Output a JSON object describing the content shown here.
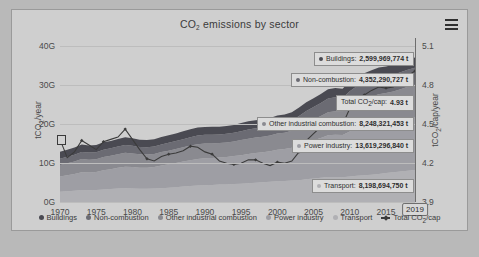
{
  "chart": {
    "title": "CO2 emissions by sector",
    "title_pre": "CO",
    "title_sub": "2",
    "title_post": " emissions by sector",
    "menu_icon": "hamburger-menu-icon"
  },
  "axes": {
    "left_title_pre": "tCO",
    "left_title_sub": "2",
    "left_title_post": "/year",
    "right_title_pre": "tCO",
    "right_title_sub": "2",
    "right_title_post": "/cap/year",
    "left_ticks": [
      "40G",
      "30G",
      "20G",
      "10G",
      "0G"
    ],
    "right_ticks": [
      "5.1",
      "4.8",
      "4.5",
      "4.2",
      "3.9"
    ],
    "x_ticks": [
      "1970",
      "1975",
      "1980",
      "1985",
      "1990",
      "1995",
      "2000",
      "2005",
      "2010",
      "2015"
    ],
    "marker_year": "2019"
  },
  "tooltips": [
    {
      "name": "Buildings",
      "value": "2,599,969,774 t",
      "color": "#4a4a52"
    },
    {
      "name": "Non-combustion",
      "value": "4,352,290,727 t",
      "color": "#6b6b73"
    },
    {
      "name": "Total CO2/cap",
      "value": "4.93 t",
      "color": "#3b3b3b",
      "pre": "Total CO",
      "sub": "2",
      "post": "/cap:",
      "isline": true
    },
    {
      "name": "Other industrial combustion",
      "value": "8,248,321,453 t",
      "color": "#8a8a90"
    },
    {
      "name": "Power industry",
      "value": "13,619,296,840 t",
      "color": "#9e9ea4"
    },
    {
      "name": "Transport",
      "value": "8,198,694,750 t",
      "color": "#b0b0b4"
    }
  ],
  "legend": [
    {
      "label": "Buildings",
      "color": "#4a4a52",
      "type": "dot"
    },
    {
      "label": "Non-combustion",
      "color": "#6b6b73",
      "type": "dot"
    },
    {
      "label": "Other industrial combustion",
      "color": "#8a8a90",
      "type": "dot"
    },
    {
      "label": "Power industry",
      "color": "#9e9ea4",
      "type": "dot"
    },
    {
      "label": "Transport",
      "color": "#b0b0b4",
      "type": "dot"
    },
    {
      "label": "Total CO2/cap",
      "color": "#3b3b3b",
      "type": "line",
      "pre": "Total CO",
      "sub": "2",
      "post": "/cap"
    }
  ],
  "chart_data": {
    "type": "area",
    "title": "CO2 emissions by sector",
    "xlabel": "",
    "ylabel": "tCO2/year",
    "y2label": "tCO2/cap/year",
    "ylim": [
      0,
      42
    ],
    "y2lim": [
      3.78,
      5.22
    ],
    "grid": true,
    "legend_position": "bottom",
    "stacked": true,
    "x": [
      1970,
      1971,
      1972,
      1973,
      1974,
      1975,
      1976,
      1977,
      1978,
      1979,
      1980,
      1981,
      1982,
      1983,
      1984,
      1985,
      1986,
      1987,
      1988,
      1989,
      1990,
      1991,
      1992,
      1993,
      1994,
      1995,
      1996,
      1997,
      1998,
      1999,
      2000,
      2001,
      2002,
      2003,
      2004,
      2005,
      2006,
      2007,
      2008,
      2009,
      2010,
      2011,
      2012,
      2013,
      2014,
      2015,
      2016,
      2017,
      2018,
      2019
    ],
    "series": [
      {
        "name": "Transport",
        "color": "#b0b0b4",
        "unit": "Gt",
        "values": [
          2.6,
          2.75,
          2.9,
          3.05,
          3.0,
          3.05,
          3.2,
          3.3,
          3.45,
          3.5,
          3.45,
          3.4,
          3.4,
          3.45,
          3.55,
          3.65,
          3.8,
          3.95,
          4.1,
          4.2,
          4.3,
          4.35,
          4.45,
          4.5,
          4.6,
          4.7,
          4.8,
          4.95,
          5.05,
          5.2,
          5.3,
          5.35,
          5.5,
          5.6,
          5.85,
          6.0,
          6.2,
          6.4,
          6.4,
          6.35,
          6.55,
          6.7,
          6.85,
          7.0,
          7.2,
          7.4,
          7.6,
          7.8,
          8.0,
          8.2
        ]
      },
      {
        "name": "Power industry",
        "color": "#9e9ea4",
        "unit": "Gt",
        "values": [
          3.9,
          4.1,
          4.3,
          4.6,
          4.55,
          4.65,
          4.9,
          5.1,
          5.3,
          5.5,
          5.5,
          5.4,
          5.4,
          5.5,
          5.8,
          6.0,
          6.2,
          6.4,
          6.6,
          6.8,
          6.9,
          6.9,
          6.95,
          7.05,
          7.15,
          7.3,
          7.5,
          7.6,
          7.7,
          7.8,
          8.1,
          8.2,
          8.4,
          8.9,
          9.4,
          9.8,
          10.2,
          10.7,
          10.8,
          10.8,
          11.5,
          12.1,
          12.4,
          12.7,
          12.9,
          12.9,
          13.0,
          13.2,
          13.4,
          13.6
        ]
      },
      {
        "name": "Other industrial combustion",
        "color": "#8a8a90",
        "unit": "Gt",
        "values": [
          3.0,
          3.1,
          3.2,
          3.35,
          3.3,
          3.25,
          3.4,
          3.45,
          3.5,
          3.6,
          3.5,
          3.4,
          3.35,
          3.35,
          3.45,
          3.5,
          3.55,
          3.65,
          3.75,
          3.8,
          3.8,
          3.75,
          3.7,
          3.7,
          3.75,
          3.85,
          3.9,
          3.95,
          3.95,
          4.0,
          4.15,
          4.2,
          4.35,
          4.65,
          5.0,
          5.3,
          5.6,
          5.9,
          6.05,
          6.0,
          6.5,
          6.9,
          7.1,
          7.3,
          7.5,
          7.6,
          7.7,
          7.9,
          8.1,
          8.25
        ]
      },
      {
        "name": "Non-combustion",
        "color": "#6b6b73",
        "unit": "Gt",
        "values": [
          1.6,
          1.65,
          1.7,
          1.8,
          1.8,
          1.8,
          1.85,
          1.9,
          1.95,
          2.0,
          1.95,
          1.9,
          1.9,
          1.9,
          1.95,
          2.0,
          2.05,
          2.1,
          2.15,
          2.2,
          2.2,
          2.2,
          2.2,
          2.2,
          2.25,
          2.3,
          2.35,
          2.4,
          2.4,
          2.45,
          2.5,
          2.55,
          2.65,
          2.85,
          3.05,
          3.2,
          3.35,
          3.5,
          3.55,
          3.5,
          3.8,
          4.0,
          4.1,
          4.2,
          4.3,
          4.3,
          4.3,
          4.35,
          4.4,
          4.35
        ]
      },
      {
        "name": "Buildings",
        "color": "#4a4a52",
        "unit": "Gt",
        "values": [
          1.75,
          1.8,
          1.85,
          1.9,
          1.85,
          1.85,
          1.95,
          1.9,
          1.95,
          2.0,
          1.9,
          1.85,
          1.85,
          1.85,
          1.9,
          1.95,
          1.95,
          2.0,
          2.05,
          2.05,
          2.0,
          2.05,
          2.0,
          2.0,
          2.0,
          2.05,
          2.1,
          2.05,
          2.05,
          2.05,
          2.1,
          2.1,
          2.1,
          2.2,
          2.25,
          2.3,
          2.3,
          2.35,
          2.4,
          2.35,
          2.5,
          2.45,
          2.5,
          2.55,
          2.55,
          2.5,
          2.55,
          2.55,
          2.6,
          2.6
        ]
      }
    ],
    "line_series": {
      "name": "Total CO2/cap",
      "color": "#3b3b3b",
      "axis": "right",
      "unit": "tCO2/cap/year",
      "values": [
        4.33,
        4.17,
        4.22,
        4.32,
        4.28,
        4.24,
        4.31,
        4.33,
        4.35,
        4.42,
        4.33,
        4.24,
        4.16,
        4.14,
        4.18,
        4.2,
        4.21,
        4.23,
        4.27,
        4.26,
        4.22,
        4.2,
        4.14,
        4.12,
        4.11,
        4.12,
        4.15,
        4.15,
        4.12,
        4.1,
        4.13,
        4.12,
        4.14,
        4.22,
        4.32,
        4.38,
        4.44,
        4.51,
        4.52,
        4.46,
        4.6,
        4.69,
        4.72,
        4.76,
        4.79,
        4.78,
        4.79,
        4.83,
        4.89,
        4.93
      ]
    },
    "final_values": {
      "year": "2019",
      "Buildings": "2,599,969,774 t",
      "Non-combustion": "4,352,290,727 t",
      "Other industrial combustion": "8,248,321,453 t",
      "Power industry": "13,619,296,840 t",
      "Transport": "8,198,694,750 t",
      "Total CO2/cap": "4.93 t"
    }
  }
}
